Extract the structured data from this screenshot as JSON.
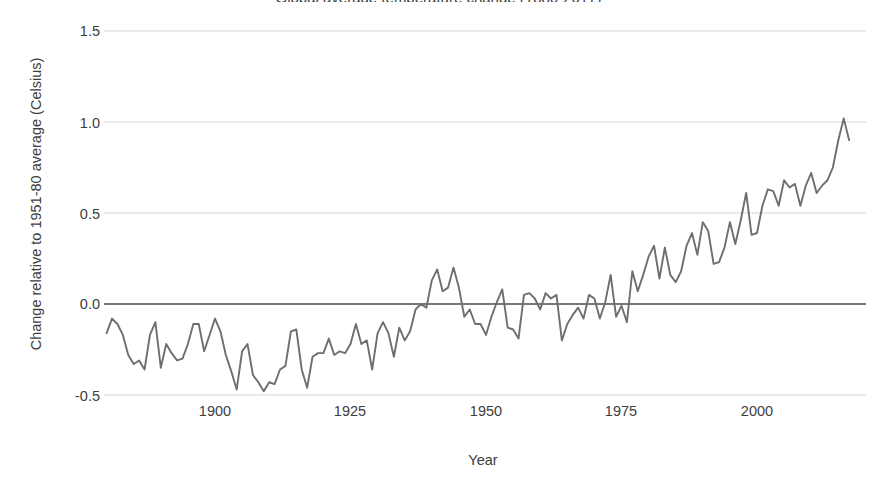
{
  "chart_data": {
    "type": "line",
    "title": "Global average temperature change (1880-2017)",
    "xlabel": "Year",
    "ylabel": "Change relative to 1951-80 average (Celsius)",
    "xlim": [
      1878,
      2018
    ],
    "ylim": [
      -0.62,
      1.55
    ],
    "xticks": [
      1900,
      1925,
      1950,
      1975,
      2000
    ],
    "xticklabels": [
      "1900",
      "1925",
      "1950",
      "1975",
      "2000"
    ],
    "yticks": [
      -0.5,
      0.0,
      0.5,
      1.0,
      1.5
    ],
    "yticklabels": [
      "-0.5",
      "0.0",
      "0.5",
      "1.0",
      "1.5"
    ],
    "grid": "horizontal",
    "zero_line": 0.0,
    "legend": "none",
    "series": [
      {
        "name": "Annual mean temperature anomaly",
        "color": "#6e6e6e",
        "x": [
          1880,
          1881,
          1882,
          1883,
          1884,
          1885,
          1886,
          1887,
          1888,
          1889,
          1890,
          1891,
          1892,
          1893,
          1894,
          1895,
          1896,
          1897,
          1898,
          1899,
          1900,
          1901,
          1902,
          1903,
          1904,
          1905,
          1906,
          1907,
          1908,
          1909,
          1910,
          1911,
          1912,
          1913,
          1914,
          1915,
          1916,
          1917,
          1918,
          1919,
          1920,
          1921,
          1922,
          1923,
          1924,
          1925,
          1926,
          1927,
          1928,
          1929,
          1930,
          1931,
          1932,
          1933,
          1934,
          1935,
          1936,
          1937,
          1938,
          1939,
          1940,
          1941,
          1942,
          1943,
          1944,
          1945,
          1946,
          1947,
          1948,
          1949,
          1950,
          1951,
          1952,
          1953,
          1954,
          1955,
          1956,
          1957,
          1958,
          1959,
          1960,
          1961,
          1962,
          1963,
          1964,
          1965,
          1966,
          1967,
          1968,
          1969,
          1970,
          1971,
          1972,
          1973,
          1974,
          1975,
          1976,
          1977,
          1978,
          1979,
          1980,
          1981,
          1982,
          1983,
          1984,
          1985,
          1986,
          1987,
          1988,
          1989,
          1990,
          1991,
          1992,
          1993,
          1994,
          1995,
          1996,
          1997,
          1998,
          1999,
          2000,
          2001,
          2002,
          2003,
          2004,
          2005,
          2006,
          2007,
          2008,
          2009,
          2010,
          2011,
          2012,
          2013,
          2014,
          2015,
          2016,
          2017
        ],
        "values": [
          -0.16,
          -0.08,
          -0.11,
          -0.17,
          -0.28,
          -0.33,
          -0.31,
          -0.36,
          -0.17,
          -0.1,
          -0.35,
          -0.22,
          -0.27,
          -0.31,
          -0.3,
          -0.22,
          -0.11,
          -0.11,
          -0.26,
          -0.17,
          -0.08,
          -0.15,
          -0.28,
          -0.37,
          -0.47,
          -0.26,
          -0.22,
          -0.39,
          -0.43,
          -0.48,
          -0.43,
          -0.44,
          -0.36,
          -0.34,
          -0.15,
          -0.14,
          -0.36,
          -0.46,
          -0.29,
          -0.27,
          -0.27,
          -0.19,
          -0.28,
          -0.26,
          -0.27,
          -0.22,
          -0.11,
          -0.22,
          -0.2,
          -0.36,
          -0.16,
          -0.1,
          -0.16,
          -0.29,
          -0.13,
          -0.2,
          -0.15,
          -0.03,
          0.0,
          -0.02,
          0.13,
          0.19,
          0.07,
          0.09,
          0.2,
          0.09,
          -0.07,
          -0.03,
          -0.11,
          -0.11,
          -0.17,
          -0.07,
          0.01,
          0.08,
          -0.13,
          -0.14,
          -0.19,
          0.05,
          0.06,
          0.03,
          -0.03,
          0.06,
          0.03,
          0.05,
          -0.2,
          -0.11,
          -0.06,
          -0.02,
          -0.08,
          0.05,
          0.03,
          -0.08,
          0.01,
          0.16,
          -0.07,
          -0.01,
          -0.1,
          0.18,
          0.07,
          0.16,
          0.26,
          0.32,
          0.14,
          0.31,
          0.16,
          0.12,
          0.18,
          0.32,
          0.39,
          0.27,
          0.45,
          0.4,
          0.22,
          0.23,
          0.31,
          0.45,
          0.33,
          0.46,
          0.61,
          0.38,
          0.39,
          0.54,
          0.63,
          0.62,
          0.54,
          0.68,
          0.64,
          0.66,
          0.54,
          0.65,
          0.72,
          0.61,
          0.65,
          0.68,
          0.75,
          0.9,
          1.02,
          0.9
        ]
      }
    ]
  },
  "axes": {
    "y_title": "Change relative to 1951-80 average (Celsius)",
    "x_title": "Year",
    "y_tick_labels": [
      "1.5",
      "1.0",
      "0.5",
      "0.0",
      "-0.5"
    ],
    "x_tick_labels": [
      "1900",
      "1925",
      "1950",
      "1975",
      "2000"
    ]
  },
  "style": {
    "line_color": "#6e6e6e",
    "grid_color": "#d6d6d6",
    "zero_line_color": "#4a4a4a",
    "text_color": "#3d3d3d",
    "background": "#ffffff"
  }
}
